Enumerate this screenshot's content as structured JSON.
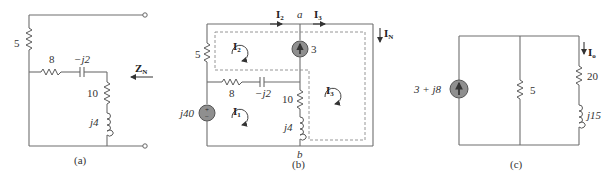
{
  "figures": [
    {
      "caption": "(a)",
      "labels": {
        "r5": "5",
        "r8": "8",
        "cap": "−j2",
        "r10": "10",
        "ind": "j4",
        "zn_main": "Z",
        "zn_sub": "N"
      }
    },
    {
      "caption": "(b)",
      "labels": {
        "r5": "5",
        "r8": "8",
        "cap": "−j2",
        "r10": "10",
        "ind": "j4",
        "vsrc": "j40",
        "isrc": "3",
        "node_a": "a",
        "node_b": "b",
        "i2_top_main": "I",
        "i2_top_sub": "2",
        "i3_top_main": "I",
        "i3_top_sub": "3",
        "in_main": "I",
        "in_sub": "N",
        "loop1_main": "I",
        "loop1_sub": "1",
        "loop2_main": "I",
        "loop2_sub": "2",
        "loop3_main": "I",
        "loop3_sub": "3"
      }
    },
    {
      "caption": "(c)",
      "labels": {
        "isrc": "3 + j8",
        "r5": "5",
        "r20": "20",
        "ind": "j15",
        "io_main": "I",
        "io_sub": "o"
      }
    }
  ]
}
